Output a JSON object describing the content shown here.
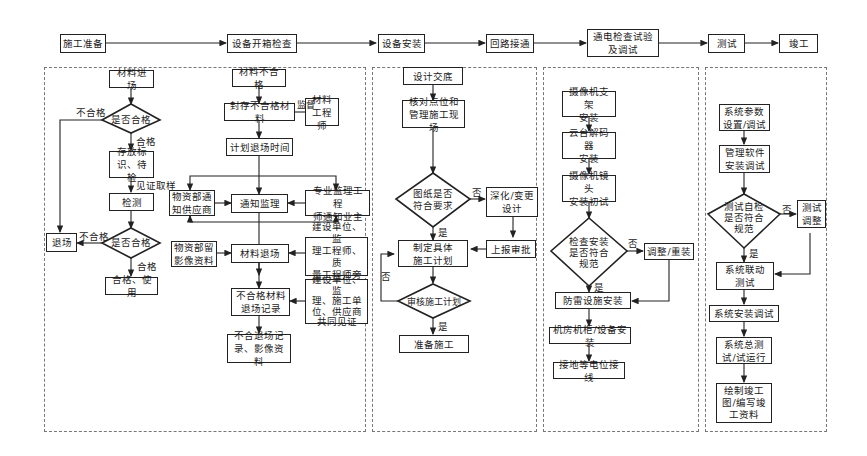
{
  "top_flow": [
    {
      "id": "s1",
      "label": "施工准备"
    },
    {
      "id": "s2",
      "label": "设备开箱检查"
    },
    {
      "id": "s3",
      "label": "设备安装"
    },
    {
      "id": "s4",
      "label": "回路接通"
    },
    {
      "id": "s5",
      "label": "通电检查试验\n及调试"
    },
    {
      "id": "s6",
      "label": "测试"
    },
    {
      "id": "s7",
      "label": "竣工"
    }
  ],
  "panel_material_inspection": {
    "nodes": {
      "arrival": "材料进场",
      "check1": "是否合格",
      "store": "存放标\n识、待检",
      "test": "检测",
      "check2": "是否合格",
      "use": "合格、使用",
      "reject": "退场"
    },
    "edge_labels": {
      "fail1": "不合格",
      "pass1": "合格",
      "witness": "见证取样",
      "fail2": "不合格",
      "pass2": "合格"
    }
  },
  "panel_nonconforming": {
    "nodes": {
      "nonconf": "材料不合格",
      "seal": "封存不合格材料",
      "engineer": "材料\n工程师",
      "plan": "计划退场时间",
      "supplier": "物资部通\n知供应商",
      "notify": "通知监理",
      "owner": "专业监理工程\n师通知业主",
      "photo": "物资部留\n影像资料",
      "exit": "材料退场",
      "onsite": "建设单位、监\n理工程师、质\n量工程师旁站",
      "record": "不合格材料\n退场记录",
      "witness": "建设单位、监\n理、施工单\n位、供应商\n共同见证",
      "archive": "不合退场记\n录、影像资料"
    },
    "edge_labels": {
      "supervise": "监督"
    }
  },
  "panel_design": {
    "nodes": {
      "disclosure": "设计交底",
      "verify": "核对点位和\n管理施工现场",
      "check": "图纸是否\n符合要求",
      "revise": "深化/变更\n设计",
      "plan": "制定具体\n施工计划",
      "report": "上报审批",
      "review": "审核施工计划",
      "prepare": "准备施工"
    },
    "edge_labels": {
      "no1": "否",
      "yes1": "是",
      "no2": "否",
      "yes2": "是"
    }
  },
  "panel_installation": {
    "nodes": {
      "bracket": "摄像机支架\n安装",
      "decoder": "云台解码器\n安装",
      "lens": "摄像机镜头\n安装初试",
      "check": "检查安装\n是否符合\n规范",
      "adjust": "调整/重装",
      "lightning": "防雷设施安装",
      "cabinet": "机房机柜/设备安装",
      "grounding": "接地等电位接线"
    },
    "edge_labels": {
      "no": "否",
      "yes": "是"
    }
  },
  "panel_testing": {
    "nodes": {
      "params": "系统参数\n设置/调试",
      "software": "管理软件\n安装调试",
      "selfcheck": "测试自检\n是否符合\n规范",
      "tune": "测试\n调整",
      "linkage": "系统联动\n测试",
      "install": "系统安装调试",
      "trial": "系统总测\n试/试运行",
      "asbuilt": "绘制竣工\n图/编写竣\n工资料"
    },
    "edge_labels": {
      "no": "否",
      "yes": "是"
    }
  },
  "colors": {
    "line": "#222222",
    "panel_border": "#777777",
    "background": "#ffffff"
  }
}
